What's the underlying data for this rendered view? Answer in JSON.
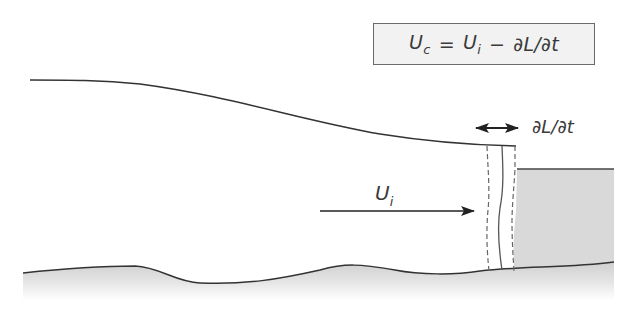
{
  "diagram": {
    "equation": {
      "lhs_symbol": "U",
      "lhs_subscript": "c",
      "equals": "=",
      "rhs_symbol": "U",
      "rhs_subscript": "i",
      "minus": "−",
      "rate_term": "∂L/∂t"
    },
    "labels": {
      "front_rate": "∂L/∂t",
      "ice_velocity_symbol": "U",
      "ice_velocity_subscript": "i"
    },
    "colors": {
      "line": "#333333",
      "water_fill": "#d9d9d9",
      "bed_fill": "#d4d4d4",
      "box_fill": "#f2f2f2",
      "text": "#3a3a3a"
    },
    "elements": [
      "ice-surface",
      "bed-profile",
      "water-body",
      "calving-front-solid",
      "calving-front-dashed-upstream",
      "calving-front-dashed-downstream",
      "front-migration-arrow",
      "ice-flow-arrow"
    ]
  }
}
